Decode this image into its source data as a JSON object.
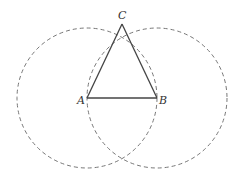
{
  "diagram": {
    "title": "",
    "points": {
      "A": {
        "label": "A",
        "x": 87,
        "y": 98
      },
      "B": {
        "label": "B",
        "x": 157,
        "y": 98
      },
      "C": {
        "label": "C",
        "x": 122,
        "y": 22
      }
    },
    "circles": [
      {
        "center": "A",
        "radius": 70,
        "style": "dashed"
      },
      {
        "center": "B",
        "radius": 70,
        "style": "dashed"
      }
    ],
    "segments": [
      [
        "A",
        "B"
      ],
      [
        "A",
        "C"
      ],
      [
        "B",
        "C"
      ]
    ],
    "colors": {
      "line": "#444444",
      "dashed": "#777777",
      "label": "#333333"
    }
  }
}
